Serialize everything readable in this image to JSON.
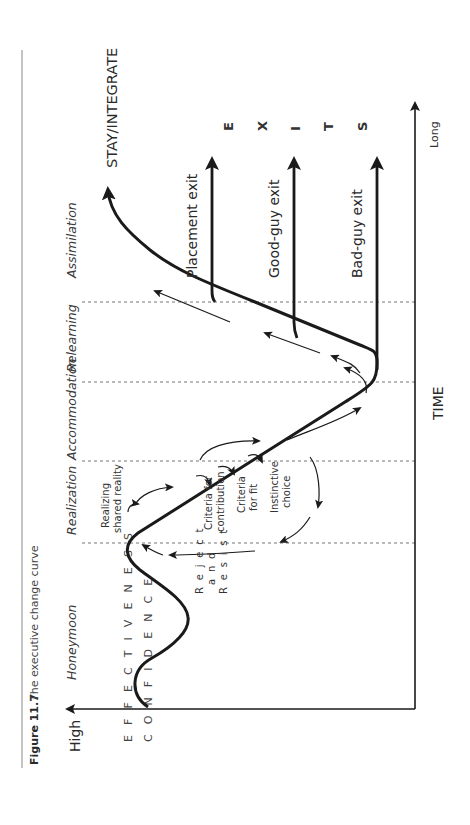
{
  "caption": {
    "figure_number": "Figure 11.7",
    "title": "The executive change curve"
  },
  "axes": {
    "y_axis_high_label": "High",
    "y_axis_label_line1": "E F F E C T I V E N E S S",
    "y_axis_label_line2": "C O N F I D E N C E",
    "x_axis_label": "TIME",
    "x_axis_end_label": "Long"
  },
  "phases": [
    {
      "label": "Honeymoon"
    },
    {
      "label": "Realization"
    },
    {
      "label": "Accommodation"
    },
    {
      "label": "Relearning"
    },
    {
      "label": "Assimilation"
    }
  ],
  "annotations": {
    "realizing_line1": "Realizing",
    "realizing_line2": "shared reality",
    "criteria_contribution_line1": "Criteria for",
    "criteria_contribution_line2": "contribution",
    "criteria_fit_line1": "Criteria",
    "criteria_fit_line2": "for fit",
    "instinctive_line1": "Instinctive",
    "instinctive_line2": "choice",
    "reject_letters": "R e j e c t",
    "and_letters": "a n d",
    "resist_letters": "R e s i s t"
  },
  "outcomes": {
    "stay": "STAY/INTEGRATE",
    "placement_exit": "Placement exit",
    "good_guy_exit": "Good-guy exit",
    "bad_guy_exit": "Bad-guy exit",
    "exits_letters": [
      "E",
      "X",
      "I",
      "T",
      "S"
    ]
  },
  "colors": {
    "ink": "#1a1a1a",
    "dash": "#777777",
    "rule": "#888888"
  }
}
